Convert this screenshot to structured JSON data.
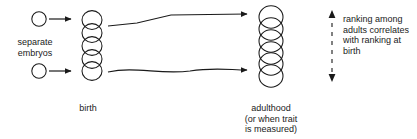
{
  "diagram": {
    "title": "ranking among adults correlates with ranking at birth",
    "type": "conceptual-biology-diagram",
    "stroke_color": "#1a1a1a",
    "background_color": "#ffffff",
    "text_color": "#1a1a1a"
  },
  "labels": {
    "separate_embryos": "separate\nembryos",
    "separate_embryos_line1": "separate",
    "separate_embryos_line2": "embryos",
    "birth": "birth",
    "adulthood_line1": "adulthood",
    "adulthood_line2": "(or when trait",
    "adulthood_line3": "is measured)"
  },
  "annotation": {
    "line1": "ranking among",
    "line2": "adults correlates",
    "line3": "with ranking at",
    "line4": "birth"
  },
  "stages": [
    {
      "name": "separate-embryos",
      "label": "separate embryos",
      "circle_count": 2,
      "circle_radius": 7,
      "description": "two small separate circles representing individual embryos"
    },
    {
      "name": "birth",
      "label": "birth",
      "circle_count": 5,
      "circle_radius": 9,
      "description": "vertical overlapping stack of circles at birth"
    },
    {
      "name": "adulthood",
      "label": "adulthood (or when trait is measured)",
      "circle_count": 6,
      "circle_radius": 11,
      "description": "vertical overlapping stack of larger circles at adulthood"
    }
  ],
  "connectors": {
    "embryo_to_birth_top": "arrow",
    "embryo_to_birth_bottom": "arrow",
    "birth_to_adulthood_top": "arrow",
    "birth_to_adulthood_bottom": "arrow",
    "ranking_span": "dashed-double-headed-vertical-arrow"
  }
}
